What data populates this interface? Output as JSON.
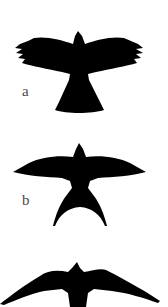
{
  "figure": {
    "silhouette_color": "#000000",
    "label_color": "#4a4a4a",
    "background": "#ffffff",
    "panels": [
      {
        "id": "a",
        "label": "a",
        "description": "broad-winged raptor silhouette with fanned tail"
      },
      {
        "id": "b",
        "label": "b",
        "description": "swallow silhouette with long forked tail"
      },
      {
        "id": "c",
        "label": "",
        "description": "falcon silhouette with long pointed wings (cropped at bottom)"
      }
    ]
  }
}
